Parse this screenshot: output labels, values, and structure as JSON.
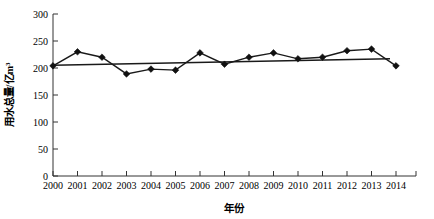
{
  "chart_data": {
    "type": "line",
    "title": "",
    "xlabel": "年份",
    "ylabel": "用水总量/亿m³",
    "categories": [
      "2000",
      "2001",
      "2002",
      "2003",
      "2004",
      "2005",
      "2006",
      "2007",
      "2008",
      "2009",
      "2010",
      "2011",
      "2012",
      "2013",
      "2014"
    ],
    "x": [
      2000,
      2001,
      2002,
      2003,
      2004,
      2005,
      2006,
      2007,
      2008,
      2009,
      2010,
      2011,
      2012,
      2013,
      2014
    ],
    "series": [
      {
        "name": "用水总量",
        "values": [
          204,
          230,
          220,
          189,
          198,
          196,
          228,
          207,
          220,
          228,
          217,
          220,
          232,
          235,
          204
        ]
      },
      {
        "name": "趋势线",
        "values": [
          205,
          206,
          207,
          208,
          208,
          209,
          210,
          211,
          212,
          212,
          213,
          214,
          215,
          216,
          217
        ]
      }
    ],
    "ylim": [
      0,
      300
    ],
    "yticks": [
      0,
      50,
      100,
      150,
      200,
      250,
      300
    ],
    "ytick_labels": [
      "0",
      "50",
      "100",
      "150",
      "200",
      "250",
      "300"
    ],
    "xlim": [
      2000,
      2014
    ],
    "grid": false,
    "legend": "none",
    "marker": "diamond",
    "line_color": "#111111",
    "trend_color": "#111111"
  },
  "axes": {
    "y_title": "用水总量/亿m³",
    "x_title": "年份"
  }
}
